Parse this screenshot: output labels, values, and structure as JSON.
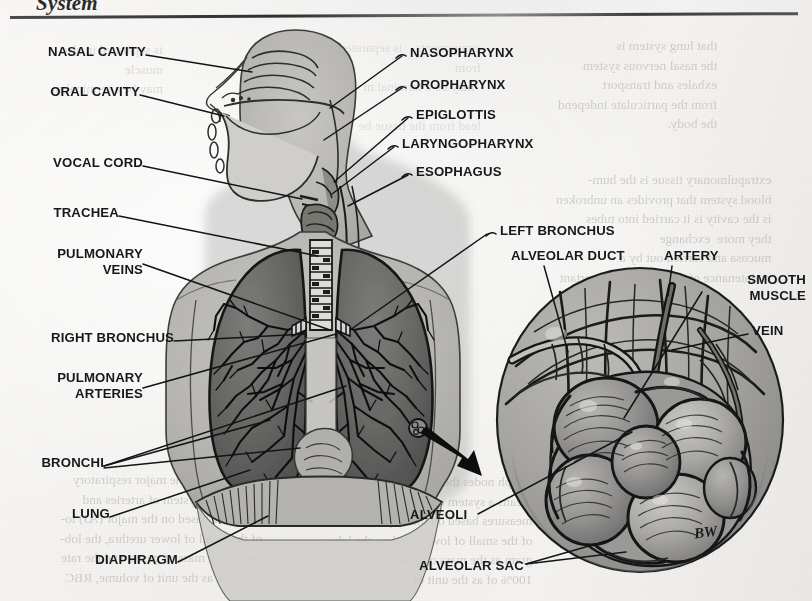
{
  "header": {
    "chapter_title": "System",
    "rule": "horizontal-rule"
  },
  "figure": {
    "signature": "BW",
    "inset": "alveolar-sac-magnification"
  },
  "labels_left": [
    {
      "id": "nasal-cavity",
      "text": "NASAL CAVITY",
      "x": 28,
      "y": 50,
      "lines": 1
    },
    {
      "id": "oral-cavity",
      "text": "ORAL CAVITY",
      "x": 33,
      "y": 90,
      "lines": 1
    },
    {
      "id": "vocal-cord",
      "text": "VOCAL CORD",
      "x": 34,
      "y": 162,
      "lines": 1
    },
    {
      "id": "trachea",
      "text": "TRACHEA",
      "x": 50,
      "y": 212,
      "lines": 1
    },
    {
      "id": "pulmonary-veins",
      "text": "PULMONARY\nVEINS",
      "x": 26,
      "y": 260,
      "lines": 2
    },
    {
      "id": "right-bronchus",
      "text": "RIGHT BRONCHUS",
      "x": 27,
      "y": 337,
      "lines": 1
    },
    {
      "id": "pulmonary-arteries",
      "text": "PULMONARY\nARTERIES",
      "x": 26,
      "y": 383,
      "lines": 2
    },
    {
      "id": "bronchi",
      "text": "BRONCHI",
      "x": 30,
      "y": 462,
      "lines": 1
    },
    {
      "id": "lung",
      "text": "LUNG",
      "x": 67,
      "y": 513,
      "lines": 1
    },
    {
      "id": "diaphragm",
      "text": "DIAPHRAGM",
      "x": 62,
      "y": 559,
      "lines": 1
    }
  ],
  "labels_right": [
    {
      "id": "nasopharynx",
      "text": "NASOPHARYNX",
      "x": 406,
      "y": 52
    },
    {
      "id": "oropharynx",
      "text": "OROPHARYNX",
      "x": 406,
      "y": 84
    },
    {
      "id": "epiglottis",
      "text": "EPIGLOTTIS",
      "x": 412,
      "y": 114
    },
    {
      "id": "laryngopharynx",
      "text": "LARYNGOPHARYNX",
      "x": 398,
      "y": 143
    },
    {
      "id": "esophagus",
      "text": "ESOPHAGUS",
      "x": 412,
      "y": 171
    },
    {
      "id": "left-bronchus",
      "text": "LEFT BRONCHUS",
      "x": 491,
      "y": 230
    }
  ],
  "labels_inset": [
    {
      "id": "alveolar-duct",
      "text": "ALVEOLAR DUCT",
      "x": 510,
      "y": 255
    },
    {
      "id": "artery",
      "text": "ARTERY",
      "x": 665,
      "y": 255
    },
    {
      "id": "smooth-muscle",
      "text": "SMOOTH\nMUSCLE",
      "x": 707,
      "y": 281
    },
    {
      "id": "vein",
      "text": "VEIN",
      "x": 752,
      "y": 330
    }
  ],
  "labels_bottom": [
    {
      "id": "alveoli",
      "text": "ALVEOLI",
      "x": 412,
      "y": 515
    },
    {
      "id": "alveolar-sac",
      "text": "ALVEOLAR SAC",
      "x": 420,
      "y": 566
    }
  ],
  "bleed_text": {
    "top_right": "that lung system is\nthe nasal nervous system\nexhales and transport\nfrom the particulate independ\nthe body.",
    "mid_right": "extrapulmonary tissue is the hum-\nblood system that provides an unbroken\nis the cavity is it carried into tubes\nthey more  exchange\nmucosa and carried out by a\nmaintenance of the system is important",
    "bottom_right": "have the\nfrom the\nvessel canal with alveolar cells\nintercellular material (matrix, etc.",
    "bottom_left": "lymph nodes, the major respiratory\nmeans as a system of arteries and\nmeasures based on the major (AJ) lo-\nof the small of lower urethra, the lob-\nand as the mass of gases, and the rate\n100% of as the unit of volume, RBC",
    "bottom_center": "lymph nodes the major respiratory\nmeans a system of arteries and\nmeasures based on the major (A.) lo-\nof the small of lower urethra, the lob-\ngram as the mass of gases, and the\n100% of as the unit of volume",
    "top_left": "is separated in also\nmuscle\nmay be a terminal m",
    "top_center": "components    is separated in also\nfrom\n  may be a terminal m\n\nlead from the tissue be"
  },
  "colors": {
    "paper": "#f4f3f1",
    "ink": "#181818",
    "body_silhouette": "#b9b8b5",
    "lung_tissue": "#6e6e6c",
    "lung_dark": "#4d4d4b",
    "inset_fill": "#a2a19e",
    "leader_line": "#1a1a1a"
  }
}
